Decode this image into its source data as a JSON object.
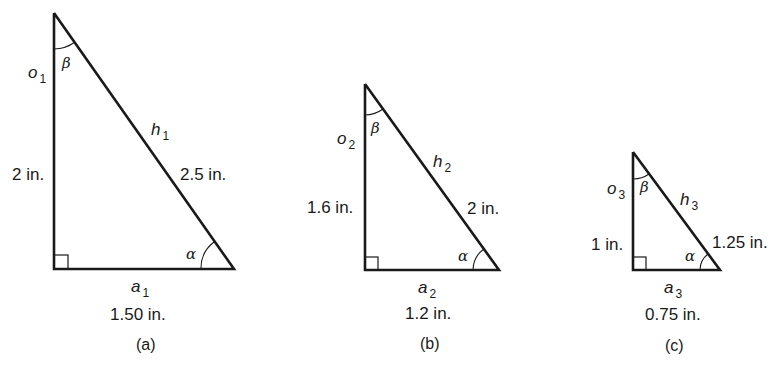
{
  "triangles": [
    {
      "id": "a",
      "caption": "(a)",
      "opposite": {
        "symbol": "o",
        "subscript": "1",
        "length": "2 in."
      },
      "adjacent": {
        "symbol": "a",
        "subscript": "1",
        "length": "1.50 in."
      },
      "hypotenuse": {
        "symbol": "h",
        "subscript": "1",
        "length": "2.5 in."
      },
      "angles": {
        "top": "β",
        "bottom": "α"
      }
    },
    {
      "id": "b",
      "caption": "(b)",
      "opposite": {
        "symbol": "o",
        "subscript": "2",
        "length": "1.6 in."
      },
      "adjacent": {
        "symbol": "a",
        "subscript": "2",
        "length": "1.2 in."
      },
      "hypotenuse": {
        "symbol": "h",
        "subscript": "2",
        "length": "2 in."
      },
      "angles": {
        "top": "β",
        "bottom": "α"
      }
    },
    {
      "id": "c",
      "caption": "(c)",
      "opposite": {
        "symbol": "o",
        "subscript": "3",
        "length": "1 in."
      },
      "adjacent": {
        "symbol": "a",
        "subscript": "3",
        "length": "0.75 in."
      },
      "hypotenuse": {
        "symbol": "h",
        "subscript": "3",
        "length": "1.25 in."
      },
      "angles": {
        "top": "β",
        "bottom": "α"
      }
    }
  ]
}
